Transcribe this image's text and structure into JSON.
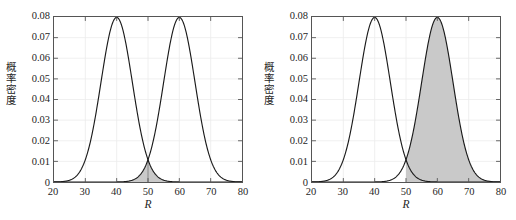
{
  "figure": {
    "background": "#ffffff",
    "axis_color": "#555555",
    "grid_color": "#ececec",
    "curve_color": "#1a1a1a",
    "fill_color": "#c9c9c9",
    "top_artifact_text": ""
  },
  "chart_data": [
    {
      "id": "left-panel",
      "type": "line",
      "title": "",
      "xlabel": "R",
      "ylabel": "概率密度",
      "xlim": [
        20,
        80
      ],
      "ylim": [
        0,
        0.08
      ],
      "xticks": [
        20,
        30,
        40,
        50,
        60,
        70,
        80
      ],
      "yticks": [
        0,
        0.01,
        0.02,
        0.03,
        0.04,
        0.05,
        0.06,
        0.07,
        0.08
      ],
      "ytick_labels": [
        "0",
        "0.01",
        "0.02",
        "0.03",
        "0.04",
        "0.05",
        "0.06",
        "0.07",
        "0.08"
      ],
      "xtick_labels": [
        "20",
        "30",
        "40",
        "50",
        "60",
        "70",
        "80"
      ],
      "grid": true,
      "legend": "none",
      "series": [
        {
          "name": "normal-left",
          "distribution": "normal",
          "mean": 40,
          "sigma": 5,
          "peak": 0.0798
        },
        {
          "name": "normal-right",
          "distribution": "normal",
          "mean": 60,
          "sigma": 5,
          "peak": 0.0798
        }
      ],
      "shaded_regions": [
        {
          "name": "overlap-left-tail",
          "series": "normal-right",
          "from": 20,
          "to": 50,
          "note": "right curve left tail below x=50"
        },
        {
          "name": "overlap-right-tail",
          "series": "normal-left",
          "from": 50,
          "to": 80,
          "note": "left curve right tail above x=50"
        }
      ],
      "threshold": 50
    },
    {
      "id": "right-panel",
      "type": "line",
      "title": "",
      "xlabel": "R",
      "ylabel": "概率密度",
      "xlim": [
        20,
        80
      ],
      "ylim": [
        0,
        0.08
      ],
      "xticks": [
        20,
        30,
        40,
        50,
        60,
        70,
        80
      ],
      "yticks": [
        0,
        0.01,
        0.02,
        0.03,
        0.04,
        0.05,
        0.06,
        0.07,
        0.08
      ],
      "ytick_labels": [
        "0",
        "0.01",
        "0.02",
        "0.03",
        "0.04",
        "0.05",
        "0.06",
        "0.07",
        "0.08"
      ],
      "xtick_labels": [
        "20",
        "30",
        "40",
        "50",
        "60",
        "70",
        "80"
      ],
      "grid": true,
      "legend": "none",
      "series": [
        {
          "name": "normal-left",
          "distribution": "normal",
          "mean": 40,
          "sigma": 5,
          "peak": 0.0798
        },
        {
          "name": "normal-right",
          "distribution": "normal",
          "mean": 60,
          "sigma": 5,
          "peak": 0.0798
        }
      ],
      "shaded_regions": [
        {
          "name": "right-curve-upper-region",
          "series": "normal-right",
          "from": 50,
          "to": 80,
          "note": "entire right curve area above x=50"
        }
      ],
      "threshold": 50
    }
  ]
}
